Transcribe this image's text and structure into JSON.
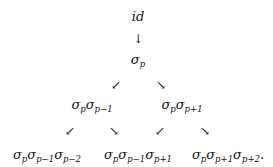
{
  "diagram": {
    "root": {
      "text": "id"
    },
    "level1": {
      "symbol": "σ",
      "sub": "p"
    },
    "level2": [
      {
        "factors": [
          {
            "symbol": "σ",
            "sub": "p"
          },
          {
            "symbol": "σ",
            "sub": "p−1"
          }
        ]
      },
      {
        "factors": [
          {
            "symbol": "σ",
            "sub": "p"
          },
          {
            "symbol": "σ",
            "sub": "p+1"
          }
        ]
      }
    ],
    "level3": [
      {
        "factors": [
          {
            "symbol": "σ",
            "sub": "p"
          },
          {
            "symbol": "σ",
            "sub": "p−1"
          },
          {
            "symbol": "σ",
            "sub": "p−2"
          }
        ],
        "suffix": ""
      },
      {
        "factors": [
          {
            "symbol": "σ",
            "sub": "p"
          },
          {
            "symbol": "σ",
            "sub": "p−1"
          },
          {
            "symbol": "σ",
            "sub": "p+1"
          }
        ],
        "suffix": ""
      },
      {
        "factors": [
          {
            "symbol": "σ",
            "sub": "p"
          },
          {
            "symbol": "σ",
            "sub": "p+1"
          },
          {
            "symbol": "σ",
            "sub": "p+2"
          }
        ],
        "suffix": "."
      }
    ],
    "arrows": {
      "down": "↓",
      "down_left": "↙",
      "down_right": "↘"
    }
  }
}
